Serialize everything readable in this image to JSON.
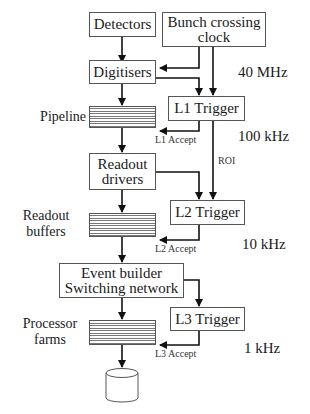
{
  "boxes": {
    "detectors": "Detectors",
    "bunch_crossing_line1": "Bunch crossing",
    "bunch_crossing_line2": "clock",
    "digitisers": "Digitisers",
    "l1_trigger": "L1 Trigger",
    "readout_drivers_line1": "Readout",
    "readout_drivers_line2": "drivers",
    "l2_trigger": "L2 Trigger",
    "event_builder_line1": "Event builder",
    "event_builder_line2": "Switching network",
    "l3_trigger": "L3 Trigger"
  },
  "stacks": {
    "pipeline": "Pipeline",
    "readout_buffers_line1": "Readout",
    "readout_buffers_line2": "buffers",
    "processor_farms_line1": "Processor",
    "processor_farms_line2": "farms"
  },
  "signals": {
    "l1_accept": "L1 Accept",
    "l2_accept": "L2 Accept",
    "l3_accept": "L3 Accept",
    "roi": "ROI"
  },
  "rates": {
    "r40mhz": "40 MHz",
    "r100khz": "100 kHz",
    "r10khz": "10 kHz",
    "r1khz": "1 kHz"
  },
  "storage": "storage-cylinder"
}
